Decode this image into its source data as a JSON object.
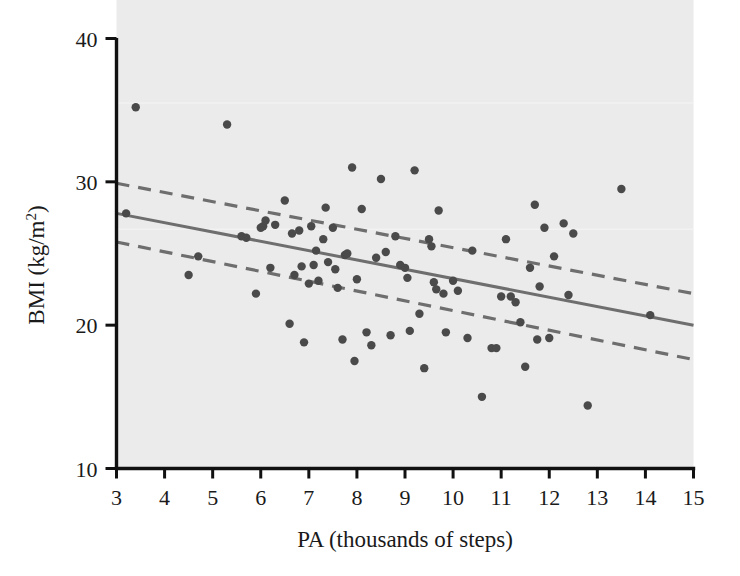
{
  "chart_data": {
    "type": "scatter",
    "title": "",
    "xlabel": "PA (thousands of steps)",
    "ylabel": "BMI (kg/m2)",
    "ylabel_base": "BMI (kg/",
    "ylabel_unit": "m",
    "ylabel_exponent": "2",
    "ylabel_close": ")",
    "xlim": [
      3,
      15
    ],
    "ylim": [
      10,
      40
    ],
    "xticks": [
      3,
      4,
      5,
      6,
      7,
      8,
      9,
      10,
      11,
      12,
      13,
      14,
      15
    ],
    "xtick_labels": [
      "3",
      "4",
      "5",
      "6",
      "7",
      "8",
      "9",
      "10",
      "11",
      "12",
      "13",
      "14",
      "15"
    ],
    "yticks": [
      10,
      20,
      30,
      40
    ],
    "ytick_labels": [
      "10",
      "20",
      "30",
      "40"
    ],
    "grid": false,
    "legend": "none",
    "plot_background": "#ebebeb",
    "point_color": "#4a4a4a",
    "line_color": "#6e6e6e",
    "axis_color": "#111111",
    "point_radius_px": 4.2,
    "fit_line": {
      "label": "linear regression fit",
      "style": "solid",
      "x": [
        3,
        15
      ],
      "y": [
        27.8,
        20.0
      ]
    },
    "confidence_band_upper": {
      "label": "95% CI upper",
      "style": "dashed",
      "x": [
        3,
        15
      ],
      "y": [
        29.9,
        22.2
      ]
    },
    "confidence_band_lower": {
      "label": "95% CI lower",
      "style": "dashed",
      "x": [
        3,
        15
      ],
      "y": [
        25.8,
        17.6
      ]
    },
    "points": [
      [
        3.4,
        35.2
      ],
      [
        3.2,
        27.8
      ],
      [
        4.5,
        23.5
      ],
      [
        4.7,
        24.8
      ],
      [
        5.3,
        34.0
      ],
      [
        5.6,
        26.2
      ],
      [
        5.7,
        26.1
      ],
      [
        5.9,
        22.2
      ],
      [
        6.0,
        26.8
      ],
      [
        6.05,
        26.9
      ],
      [
        6.1,
        27.3
      ],
      [
        6.2,
        24.0
      ],
      [
        6.3,
        27.0
      ],
      [
        6.5,
        28.7
      ],
      [
        6.6,
        20.1
      ],
      [
        6.65,
        26.4
      ],
      [
        6.7,
        23.5
      ],
      [
        6.8,
        26.6
      ],
      [
        6.85,
        24.1
      ],
      [
        6.9,
        18.8
      ],
      [
        7.0,
        22.9
      ],
      [
        7.05,
        26.9
      ],
      [
        7.1,
        24.2
      ],
      [
        7.15,
        25.2
      ],
      [
        7.2,
        23.1
      ],
      [
        7.3,
        26.0
      ],
      [
        7.35,
        28.2
      ],
      [
        7.4,
        24.4
      ],
      [
        7.5,
        26.8
      ],
      [
        7.55,
        23.9
      ],
      [
        7.6,
        22.6
      ],
      [
        7.7,
        19.0
      ],
      [
        7.75,
        24.9
      ],
      [
        7.8,
        25.0
      ],
      [
        7.9,
        31.0
      ],
      [
        7.95,
        17.5
      ],
      [
        8.0,
        23.2
      ],
      [
        8.1,
        28.1
      ],
      [
        8.2,
        19.5
      ],
      [
        8.3,
        18.6
      ],
      [
        8.4,
        24.7
      ],
      [
        8.5,
        30.2
      ],
      [
        8.6,
        25.1
      ],
      [
        8.7,
        19.3
      ],
      [
        8.8,
        26.2
      ],
      [
        8.9,
        24.2
      ],
      [
        9.0,
        24.0
      ],
      [
        9.05,
        23.3
      ],
      [
        9.1,
        19.6
      ],
      [
        9.2,
        30.8
      ],
      [
        9.3,
        20.8
      ],
      [
        9.4,
        17.0
      ],
      [
        9.5,
        26.0
      ],
      [
        9.55,
        25.5
      ],
      [
        9.6,
        23.0
      ],
      [
        9.65,
        22.5
      ],
      [
        9.7,
        28.0
      ],
      [
        9.8,
        22.2
      ],
      [
        9.85,
        19.5
      ],
      [
        10.0,
        23.1
      ],
      [
        10.1,
        22.4
      ],
      [
        10.3,
        19.1
      ],
      [
        10.4,
        25.2
      ],
      [
        10.6,
        15.0
      ],
      [
        10.8,
        18.4
      ],
      [
        10.9,
        18.4
      ],
      [
        11.0,
        22.0
      ],
      [
        11.1,
        26.0
      ],
      [
        11.2,
        22.0
      ],
      [
        11.3,
        21.6
      ],
      [
        11.4,
        20.2
      ],
      [
        11.5,
        17.1
      ],
      [
        11.6,
        24.0
      ],
      [
        11.7,
        28.4
      ],
      [
        11.75,
        19.0
      ],
      [
        11.8,
        22.7
      ],
      [
        11.9,
        26.8
      ],
      [
        12.0,
        19.1
      ],
      [
        12.1,
        24.8
      ],
      [
        12.3,
        27.1
      ],
      [
        12.4,
        22.1
      ],
      [
        12.5,
        26.4
      ],
      [
        12.8,
        14.4
      ],
      [
        13.5,
        29.5
      ],
      [
        14.1,
        20.7
      ]
    ]
  }
}
